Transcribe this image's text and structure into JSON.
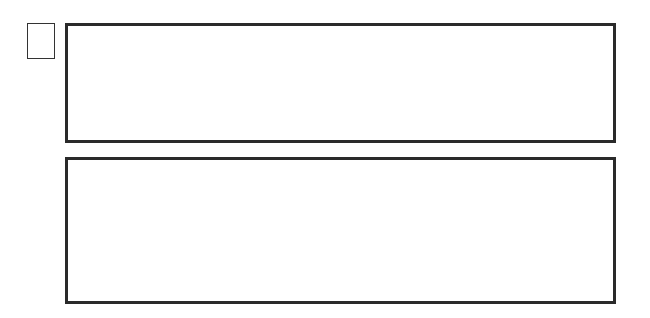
{
  "question": {
    "number": "3"
  },
  "colors": {
    "line": "#222222",
    "block": "#111111",
    "background": "#ffffff"
  },
  "instructions_panel": {
    "cells": [
      {
        "shape": "monkey",
        "moves": [
          "up",
          "down",
          "left",
          "right",
          "up-left",
          "up-right",
          "down-left",
          "down-right"
        ]
      },
      {
        "shape": "circle",
        "moves": [
          "up",
          "down",
          "left",
          "right"
        ]
      },
      {
        "shape": "star",
        "moves": [
          "up"
        ]
      },
      {
        "shape": "diamond",
        "moves": [
          "down"
        ]
      },
      {
        "shape": "triangle",
        "moves": [
          "right"
        ]
      },
      {
        "shape": "square",
        "moves": [
          "left"
        ]
      }
    ]
  },
  "options_panel": {
    "options": [
      {
        "grid": [
          [
            "banana",
            "triangle",
            "square"
          ],
          [
            "black",
            "diamond",
            "star"
          ],
          [
            "monkey",
            "black",
            "circle"
          ]
        ]
      },
      {
        "grid": [
          [
            "banana",
            "diamond",
            "circle"
          ],
          [
            "black",
            "star",
            "triangle"
          ],
          [
            "monkey",
            "black",
            "square"
          ]
        ]
      },
      {
        "grid": [
          [
            "banana",
            "star",
            "diamond"
          ],
          [
            "black",
            "circle",
            "triangle"
          ],
          [
            "monkey",
            "black",
            "square"
          ]
        ]
      },
      {
        "grid": [
          [
            "banana",
            "square",
            "diamond"
          ],
          [
            "black",
            "circle",
            "star"
          ],
          [
            "monkey",
            "black",
            "triangle"
          ]
        ]
      }
    ]
  }
}
